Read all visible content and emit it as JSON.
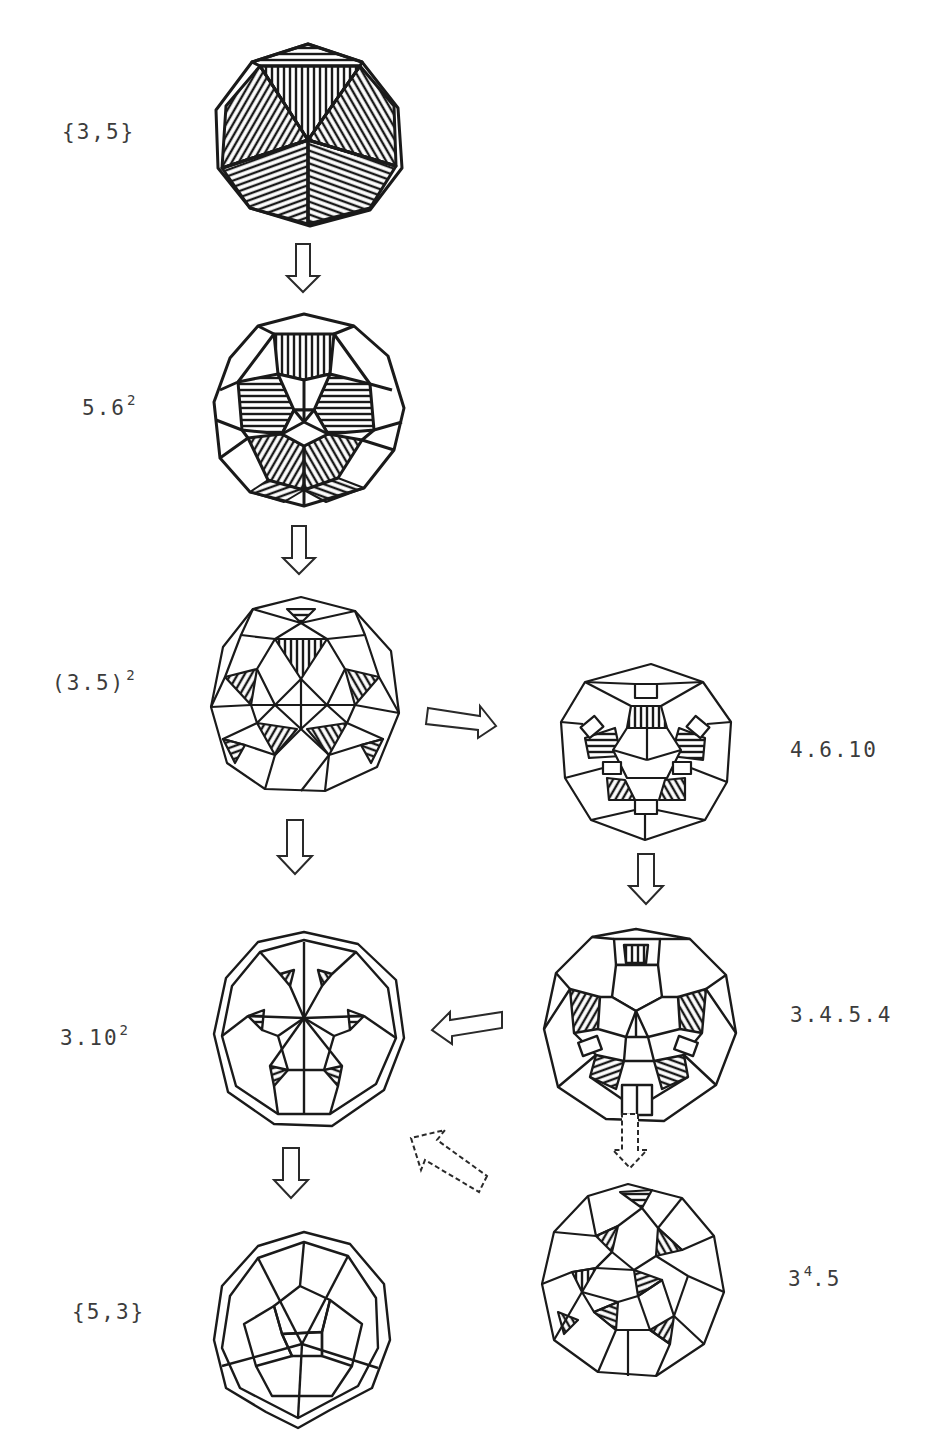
{
  "diagram": {
    "type": "polyhedra-truncation-sequence",
    "nodes": [
      {
        "id": "icosahedron",
        "label": "{3,5}",
        "base": "{3,5}",
        "sup": "",
        "position": "left column, row 1"
      },
      {
        "id": "truncated-icosahedron",
        "label": "5.6²",
        "base": "5.6",
        "sup": "2",
        "position": "left column, row 2"
      },
      {
        "id": "icosidodecahedron",
        "label": "(3.5)²",
        "base": "(3.5)",
        "sup": "2",
        "position": "left column, row 3"
      },
      {
        "id": "truncated-icosidodecahedron",
        "label": "4.6.10",
        "base": "4.6.10",
        "sup": "",
        "position": "right column, row 3"
      },
      {
        "id": "rhombicosidodecahedron",
        "label": "3.4.5.4",
        "base": "3.4.5.4",
        "sup": "",
        "position": "right column, row 4"
      },
      {
        "id": "truncated-dodecahedron",
        "label": "3.10²",
        "base": "3.10",
        "sup": "2",
        "position": "left column, row 4"
      },
      {
        "id": "snub-dodecahedron",
        "label": "3⁴.5",
        "base": "3",
        "sup": "4",
        "tail": ".5",
        "position": "right column, row 5"
      },
      {
        "id": "dodecahedron",
        "label": "{5,3}",
        "base": "{5,3}",
        "sup": "",
        "position": "left column, row 5"
      }
    ],
    "edges": [
      {
        "from": "{3,5}",
        "to": "5.6²",
        "style": "solid",
        "direction": "down"
      },
      {
        "from": "5.6²",
        "to": "(3.5)²",
        "style": "solid",
        "direction": "down"
      },
      {
        "from": "(3.5)²",
        "to": "4.6.10",
        "style": "solid",
        "direction": "right"
      },
      {
        "from": "(3.5)²",
        "to": "3.10²",
        "style": "solid",
        "direction": "down"
      },
      {
        "from": "4.6.10",
        "to": "3.4.5.4",
        "style": "solid",
        "direction": "down"
      },
      {
        "from": "3.4.5.4",
        "to": "3.10²",
        "style": "solid",
        "direction": "left"
      },
      {
        "from": "3.4.5.4",
        "to": "3⁴.5",
        "style": "dashed",
        "direction": "down"
      },
      {
        "from": "3⁴.5",
        "to": "3.10²",
        "style": "dashed",
        "direction": "up-left"
      },
      {
        "from": "3.10²",
        "to": "{5,3}",
        "style": "solid",
        "direction": "down"
      }
    ],
    "colors": {
      "ink": "#1a1a1a",
      "label": "#3c3c3c",
      "background": "#ffffff"
    }
  }
}
